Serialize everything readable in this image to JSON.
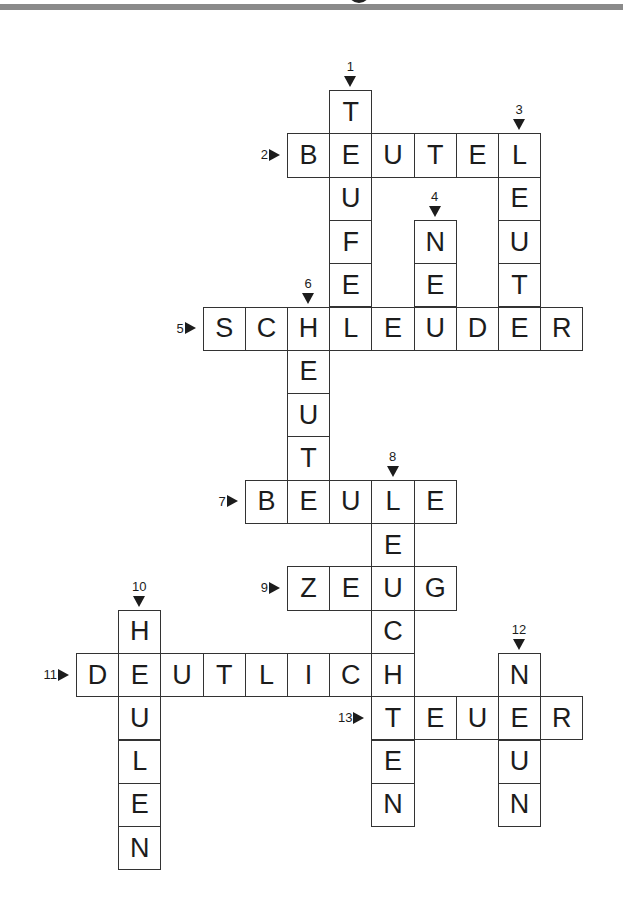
{
  "puzzle": {
    "type": "crossword",
    "language": "de",
    "grid": {
      "origin_x": 76,
      "origin_y": 90,
      "cell_w": 42.2,
      "cell_h": 43.3
    },
    "words": [
      {
        "number": "1",
        "direction": "down",
        "row": 0,
        "col": 6,
        "answer": "TEUFEL"
      },
      {
        "number": "2",
        "direction": "across",
        "row": 1,
        "col": 5,
        "answer": "BEUTEL"
      },
      {
        "number": "3",
        "direction": "down",
        "row": 1,
        "col": 10,
        "answer": "LEUTE"
      },
      {
        "number": "4",
        "direction": "down",
        "row": 3,
        "col": 8,
        "answer": "NEU"
      },
      {
        "number": "5",
        "direction": "across",
        "row": 5,
        "col": 3,
        "answer": "SCHLEUDER"
      },
      {
        "number": "6",
        "direction": "down",
        "row": 5,
        "col": 5,
        "answer": "HEUT"
      },
      {
        "number": "7",
        "direction": "across",
        "row": 9,
        "col": 4,
        "answer": "BEULE"
      },
      {
        "number": "8",
        "direction": "down",
        "row": 9,
        "col": 7,
        "answer": "LEUCHTEN"
      },
      {
        "number": "9",
        "direction": "across",
        "row": 11,
        "col": 5,
        "answer": "ZEUG"
      },
      {
        "number": "10",
        "direction": "down",
        "row": 12,
        "col": 1,
        "answer": "HEULEN"
      },
      {
        "number": "11",
        "direction": "across",
        "row": 13,
        "col": 0,
        "answer": "DEUTLICH"
      },
      {
        "number": "12",
        "direction": "down",
        "row": 13,
        "col": 10,
        "answer": "NEUN"
      },
      {
        "number": "13",
        "direction": "across",
        "row": 14,
        "col": 7,
        "answer": "TEUER"
      }
    ]
  },
  "colors": {
    "border": "#333333",
    "text": "#1c1c1c",
    "header_bar": "#8a8a8a"
  }
}
